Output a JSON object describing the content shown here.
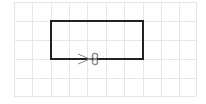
{
  "diagram": {
    "grid": {
      "x_lines": [
        14,
        32,
        51,
        69,
        87,
        106,
        124,
        143,
        161,
        179,
        196
      ],
      "y_lines": [
        2,
        21,
        40,
        59,
        78,
        96
      ],
      "color": "#e6e6e6"
    },
    "rectangle": {
      "x": 51,
      "y": 21,
      "width": 92,
      "height": 38,
      "stroke": "#222222",
      "stroke_width": 2
    },
    "scissors": {
      "icon": "scissors-icon",
      "x": 88,
      "y": 59,
      "color": "#888888"
    }
  }
}
